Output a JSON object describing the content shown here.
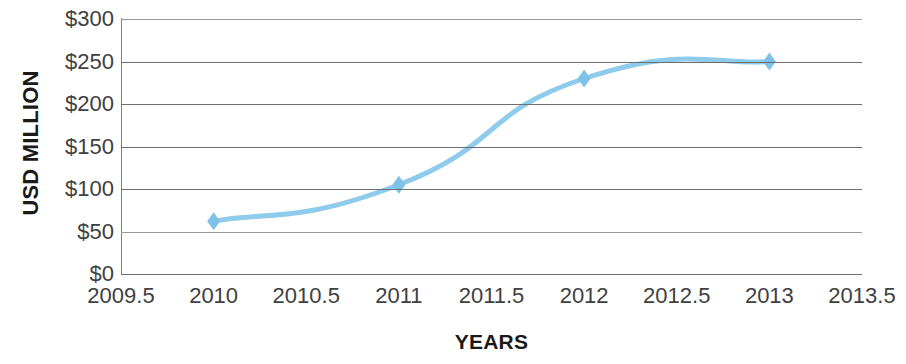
{
  "chart_data": {
    "type": "line",
    "title": "",
    "xlabel": "YEARS",
    "ylabel": "USD MILLION",
    "x": [
      2010,
      2011,
      2012,
      2013
    ],
    "values": [
      62,
      105,
      230,
      250
    ],
    "series": [
      {
        "name": "USD Million",
        "x": [
          2010,
          2011,
          2012,
          2013
        ],
        "values": [
          62,
          105,
          230,
          250
        ]
      }
    ],
    "xlim": [
      2009.5,
      2013.5
    ],
    "ylim": [
      0,
      300
    ],
    "x_tick_labels": [
      "2009.5",
      "2010",
      "2010.5",
      "2011",
      "2011.5",
      "2012",
      "2012.5",
      "2013",
      "2013.5"
    ],
    "x_tick_values": [
      2009.5,
      2010,
      2010.5,
      2011,
      2011.5,
      2012,
      2012.5,
      2013,
      2013.5
    ],
    "y_tick_labels": [
      "$300",
      "$250",
      "$200",
      "$150",
      "$100",
      "$50",
      "$0"
    ],
    "y_tick_values": [
      300,
      250,
      200,
      150,
      100,
      50,
      0
    ],
    "grid": true,
    "grid_orientation": "horizontal",
    "legend": false,
    "legend_position": "none",
    "smooth": true,
    "marker": "diamond",
    "line_color": "#8FCBEC",
    "marker_color": "#7EC2EA",
    "gridline_color": "#6E6E6E",
    "axis_color": "#808080",
    "background_color": "#FFFFFF",
    "text_color": "#404040",
    "title_color": "#1A1A1A",
    "line_width": 5
  }
}
